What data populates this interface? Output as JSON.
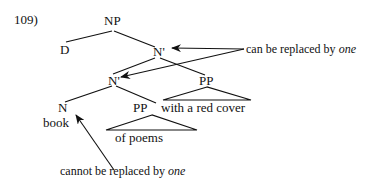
{
  "example_number": "109)",
  "tree": {
    "np": "NP",
    "d": "D",
    "nbar_top": "N'",
    "nbar_inner": "N'",
    "pp_top": "PP",
    "pp_top_text": "with a red cover",
    "n": "N",
    "n_word": "book",
    "pp_inner": "PP",
    "pp_inner_text": "of poems"
  },
  "annotations": {
    "replaceable_prefix": "can be replaced by ",
    "replaceable_word": "one",
    "not_replaceable_prefix": "cannot be replaced by ",
    "not_replaceable_word": "one"
  },
  "colors": {
    "ink": "#111111",
    "background": "#ffffff"
  }
}
